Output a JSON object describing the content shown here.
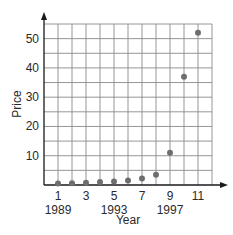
{
  "chart_data": {
    "type": "scatter",
    "title": "",
    "xlabel": "Year",
    "ylabel": "Price",
    "x_ticks": [
      1,
      3,
      5,
      7,
      9,
      11
    ],
    "x_tick_year_labels": [
      {
        "x": 1,
        "label": "1989"
      },
      {
        "x": 5,
        "label": "1993"
      },
      {
        "x": 9,
        "label": "1997"
      }
    ],
    "y_ticks": [
      10,
      20,
      30,
      40,
      50
    ],
    "xlim": [
      0,
      12
    ],
    "ylim": [
      0,
      55
    ],
    "grid": true,
    "legend": null,
    "points": [
      {
        "x": 1,
        "y": 0.5
      },
      {
        "x": 2,
        "y": 0.6
      },
      {
        "x": 3,
        "y": 0.8
      },
      {
        "x": 4,
        "y": 1.0
      },
      {
        "x": 5,
        "y": 1.2
      },
      {
        "x": 6,
        "y": 1.5
      },
      {
        "x": 7,
        "y": 2.2
      },
      {
        "x": 8,
        "y": 3.5
      },
      {
        "x": 9,
        "y": 11
      },
      {
        "x": 10,
        "y": 37
      },
      {
        "x": 11,
        "y": 52
      }
    ],
    "colors": {
      "grid": "#8a8a8a",
      "axis": "#1a1a1a",
      "point": "#6e6e6e"
    }
  },
  "labels": {
    "xlabel": "Year",
    "ylabel": "Price",
    "x_ticks": [
      "1",
      "3",
      "5",
      "7",
      "9",
      "11"
    ],
    "x_years": [
      "1989",
      "1993",
      "1997"
    ],
    "y_ticks": [
      "10",
      "20",
      "30",
      "40",
      "50"
    ]
  }
}
